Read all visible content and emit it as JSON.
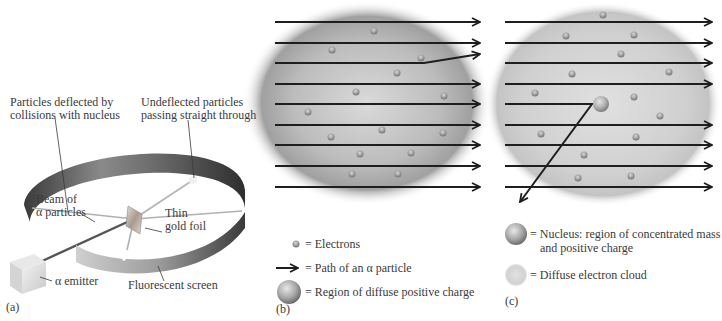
{
  "panels": {
    "a": {
      "letter": "(a)",
      "labels": {
        "deflected": [
          "Particles deflected by",
          "collisions with nucleus"
        ],
        "undeflected": [
          "Undeflected particles",
          "passing straight through"
        ],
        "beam": [
          "Beam of",
          "α particles"
        ],
        "foil": [
          "Thin",
          "gold foil"
        ],
        "emitter": "α emitter",
        "screen": "Fluorescent screen"
      }
    },
    "b": {
      "letter": "(b)",
      "model": "plum pudding",
      "arrow_count": 9,
      "deflected_arrow_index": 2,
      "electron_count": 14,
      "legend": [
        {
          "symbol": "electron-icon",
          "text": "= Electrons"
        },
        {
          "symbol": "arrow-icon",
          "text": "= Path of an α particle"
        },
        {
          "symbol": "diffuse-charge-icon",
          "text": "= Region of diffuse positive charge"
        }
      ]
    },
    "c": {
      "letter": "(c)",
      "model": "nuclear",
      "arrow_count": 9,
      "deflected_arrow_index": 4,
      "electron_count": 16,
      "legend": [
        {
          "symbol": "nucleus-icon",
          "text": [
            "= Nucleus: region of concentrated mass",
            "and positive charge"
          ]
        },
        {
          "symbol": "electron-cloud-icon",
          "text": "= Diffuse electron cloud"
        }
      ]
    }
  },
  "colors": {
    "text": "#3a3a3a",
    "arrow": "#1e1e1e",
    "sphere_core": "#bdbdbd",
    "sphere_edge": "#8a8a8a",
    "ring_dark": "#3c3c3c",
    "ring_light": "#b8b8b8"
  }
}
